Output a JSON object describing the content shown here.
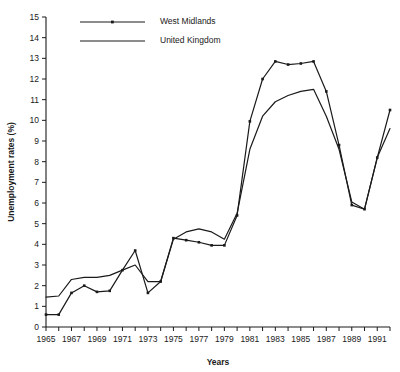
{
  "chart_data": {
    "type": "line",
    "title": "",
    "xlabel": "Years",
    "ylabel": "Unemployment rates (%)",
    "xlim": [
      1965,
      1992
    ],
    "ylim": [
      0,
      15
    ],
    "grid": false,
    "legend_position": "top-left",
    "x": [
      1965,
      1966,
      1967,
      1968,
      1969,
      1970,
      1971,
      1972,
      1973,
      1974,
      1975,
      1976,
      1977,
      1978,
      1979,
      1980,
      1981,
      1982,
      1983,
      1984,
      1985,
      1986,
      1987,
      1988,
      1989,
      1990,
      1991,
      1992
    ],
    "xtick_values": [
      1965,
      1966,
      1967,
      1968,
      1969,
      1970,
      1971,
      1972,
      1973,
      1974,
      1975,
      1976,
      1977,
      1978,
      1979,
      1980,
      1981,
      1982,
      1983,
      1984,
      1985,
      1986,
      1987,
      1988,
      1989,
      1990,
      1991,
      1992
    ],
    "xtick_labels": [
      "1965",
      "",
      "1967",
      "",
      "1969",
      "",
      "1971",
      "",
      "1973",
      "",
      "1975",
      "",
      "1977",
      "",
      "1979",
      "",
      "1981",
      "",
      "1983",
      "",
      "1985",
      "",
      "1987",
      "",
      "1989",
      "",
      "1991",
      ""
    ],
    "ytick_values": [
      0,
      1,
      2,
      3,
      4,
      5,
      6,
      7,
      8,
      9,
      10,
      11,
      12,
      13,
      14,
      15
    ],
    "ytick_labels": [
      "0",
      "1",
      "2",
      "3",
      "4",
      "5",
      "6",
      "7",
      "8",
      "9",
      "10",
      "11",
      "12",
      "13",
      "14",
      "15"
    ],
    "series": [
      {
        "name": "West Midlands",
        "marker": "square",
        "color": "#1a1a1a",
        "values": [
          0.6,
          0.6,
          1.65,
          2.0,
          1.7,
          1.75,
          2.75,
          3.7,
          1.65,
          2.2,
          4.3,
          4.2,
          4.1,
          3.95,
          3.95,
          5.4,
          9.95,
          12.0,
          12.85,
          12.7,
          12.75,
          12.85,
          11.4,
          8.8,
          5.9,
          5.7,
          8.2,
          10.5
        ]
      },
      {
        "name": "United Kingdom",
        "marker": "none",
        "color": "#1a1a1a",
        "values": [
          1.45,
          1.5,
          2.3,
          2.4,
          2.4,
          2.5,
          2.75,
          3.0,
          2.2,
          2.2,
          4.25,
          4.6,
          4.75,
          4.6,
          4.25,
          5.5,
          8.6,
          10.2,
          10.9,
          11.2,
          11.4,
          11.5,
          10.2,
          8.6,
          6.05,
          5.7,
          8.2,
          9.6
        ]
      }
    ]
  },
  "legend": {
    "items": [
      {
        "label": "West Midlands"
      },
      {
        "label": "United Kingdom"
      }
    ]
  },
  "axes": {
    "x_title": "Years",
    "y_title": "Unemployment rates (%)"
  }
}
